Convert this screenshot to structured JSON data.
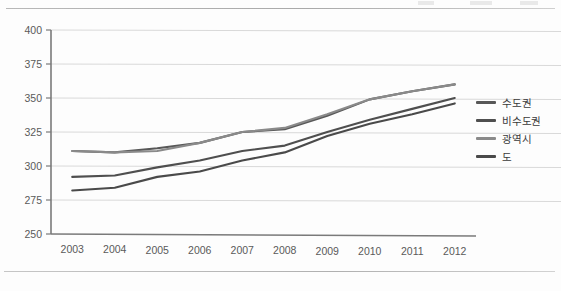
{
  "chart_data": {
    "type": "line",
    "title": "",
    "xlabel": "",
    "ylabel": "",
    "categories": [
      "2003",
      "2004",
      "2005",
      "2006",
      "2007",
      "2008",
      "2009",
      "2010",
      "2011",
      "2012"
    ],
    "x_tick_labels": [
      "2003",
      "2004",
      "2005",
      "2006",
      "2007",
      "2008",
      "2009",
      "2010",
      "2011",
      "2012"
    ],
    "y_tick_labels": [
      "250",
      "275",
      "300",
      "325",
      "350",
      "375",
      "400"
    ],
    "ylim": [
      250,
      400
    ],
    "y_step": 25,
    "grid": "horizontal",
    "legend_position": "right",
    "series": [
      {
        "name": "수도권",
        "color": "#585858",
        "values": [
          311,
          310,
          313,
          317,
          325,
          327,
          337,
          349,
          355,
          360
        ]
      },
      {
        "name": "비수도권",
        "color": "#4f4f4f",
        "values": [
          292,
          293,
          299,
          304,
          311,
          315,
          325,
          334,
          342,
          350
        ]
      },
      {
        "name": "광역시",
        "color": "#8a8a8a",
        "values": [
          311,
          310,
          311,
          317,
          325,
          328,
          338,
          349,
          355,
          360
        ]
      },
      {
        "name": "도",
        "color": "#4a4a4a",
        "values": [
          282,
          284,
          292,
          296,
          304,
          310,
          322,
          331,
          338,
          346
        ]
      }
    ]
  },
  "axis": {
    "axis_line_color": "#7a7a7a",
    "gridline_color": "#d9d9d9",
    "tick_label_color": "#5a5a5a"
  },
  "legend": {
    "items": [
      {
        "label": "수도권",
        "color": "#585858"
      },
      {
        "label": "비수도권",
        "color": "#4f4f4f"
      },
      {
        "label": "광역시",
        "color": "#8a8a8a"
      },
      {
        "label": "도",
        "color": "#4a4a4a"
      }
    ]
  }
}
